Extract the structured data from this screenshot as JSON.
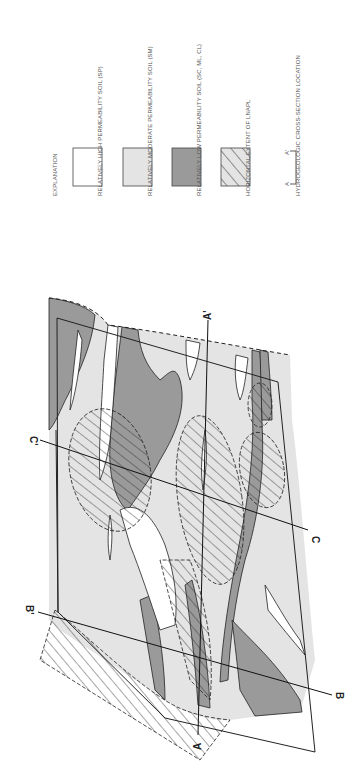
{
  "legend": {
    "title": "EXPLANATION",
    "items": [
      {
        "label": "RELATIVELY HIGH PERMEABILITY SOIL (SP)",
        "swatch": "white",
        "color": "#ffffff"
      },
      {
        "label": "RELATIVELY MODERATE PERMEABILITY SOIL (SM)",
        "swatch": "light-gray",
        "color": "#e4e4e4"
      },
      {
        "label": "RELATIVELY LOW PERMEABILITY SOIL (SC, ML, CL)",
        "swatch": "dark-gray",
        "color": "#9a9a9a"
      },
      {
        "label": "HORIZONTAL EXTENT OF LNAPL",
        "swatch": "hatched",
        "color": "#e4e4e4"
      },
      {
        "label": "HYDROGEOLOGIC CROSS-SECTION LOCATION",
        "swatch": "section-bracket",
        "start": "A",
        "end": "A'"
      }
    ]
  },
  "map": {
    "cross_sections": [
      {
        "start": "A",
        "end": "A'"
      },
      {
        "start": "B",
        "end": "B'"
      },
      {
        "start": "C",
        "end": "C'"
      }
    ]
  }
}
